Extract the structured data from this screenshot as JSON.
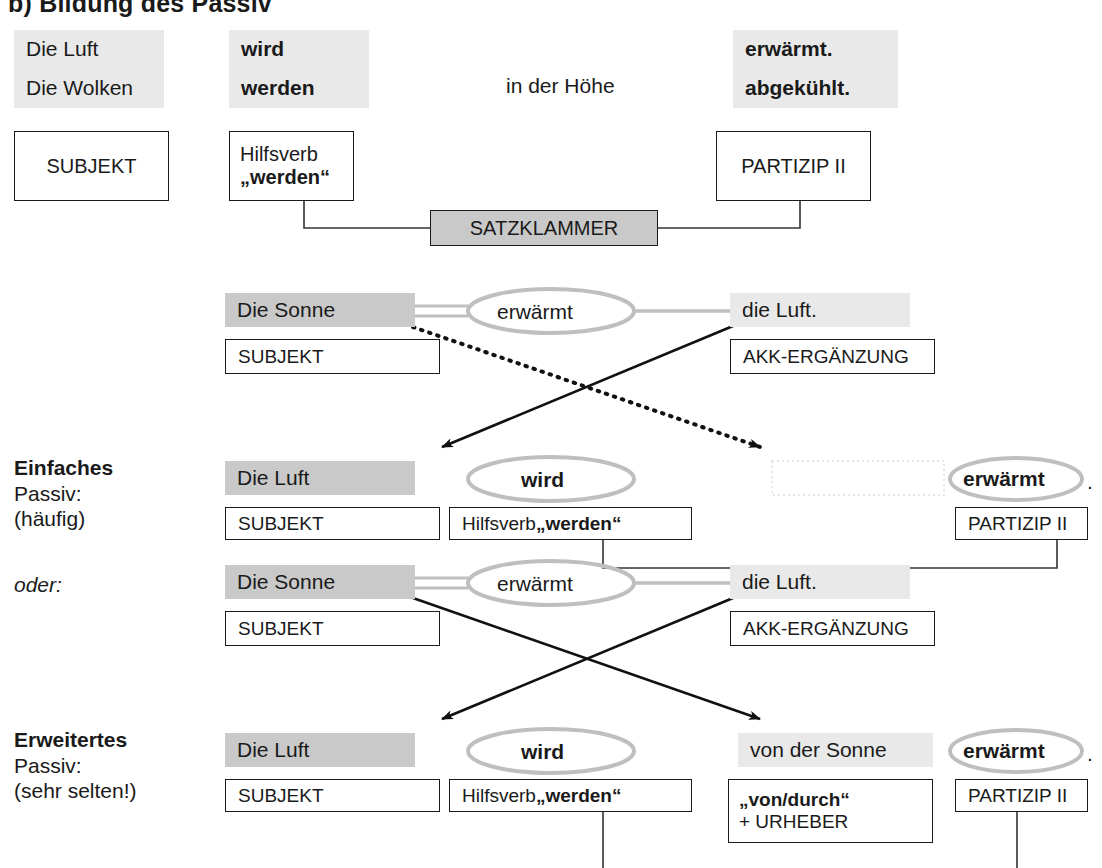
{
  "title": "b) Bildung des Passiv",
  "section1": {
    "subject_line1": "Die Luft",
    "subject_line2": "Die Wolken",
    "aux_line1": "wird",
    "aux_line2": "werden",
    "middle": "in der Höhe",
    "participle_line1": "erwärmt.",
    "participle_line2": "abgekühlt.",
    "box_subject": "SUBJEKT",
    "box_aux_line1": "Hilfsverb",
    "box_aux_line2": "„werden“",
    "box_participle": "PARTIZIP II",
    "box_bracket": "SATZKLAMMER"
  },
  "section2": {
    "active": {
      "subject": "Die Sonne",
      "verb": "erwärmt",
      "object": "die Luft.",
      "box_subject": "SUBJEKT",
      "box_object": "AKK-ERGÄNZUNG"
    },
    "caption": {
      "head": "Einfaches",
      "line2": "Passiv:",
      "line3": "(häufig)"
    },
    "passive": {
      "subject": "Die Luft",
      "aux": "wird",
      "agent": "",
      "participle": "erwärmt",
      "period": ".",
      "box_subject": "SUBJEKT",
      "box_aux_plain": "Hilfsverb ",
      "box_aux_bold": "„werden“",
      "box_participle": "PARTIZIP II"
    }
  },
  "section3": {
    "oder_label": "oder:",
    "active": {
      "subject": "Die Sonne",
      "verb": "erwärmt",
      "object": "die Luft.",
      "box_subject": "SUBJEKT",
      "box_object": "AKK-ERGÄNZUNG"
    },
    "caption": {
      "head": "Erweitertes",
      "line2": "Passiv:",
      "line3": "(sehr selten!)"
    },
    "passive": {
      "subject": "Die Luft",
      "aux": "wird",
      "agent": "von der Sonne",
      "participle": "erwärmt",
      "period": ".",
      "box_subject": "SUBJEKT",
      "box_aux_plain": "Hilfsverb ",
      "box_aux_bold": "„werden“",
      "box_agent_line1": "„von/durch“",
      "box_agent_line2": "+ URHEBER",
      "box_participle": "PARTIZIP II"
    }
  },
  "colors": {
    "highlight_light": "#e9e9e9",
    "highlight_dark": "#c9c9c9",
    "oval_gray": "#bfbfbf",
    "ink": "#1a1a1a"
  }
}
